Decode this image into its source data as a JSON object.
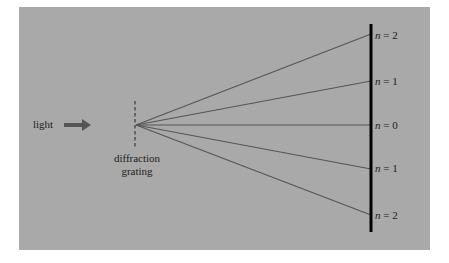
{
  "diagram": {
    "labels": {
      "light": "light",
      "grating_line1": "diffraction",
      "grating_line2": "grating"
    },
    "orders": [
      {
        "n_symbol": "n",
        "eq": " = 2",
        "y": 35
      },
      {
        "n_symbol": "n",
        "eq": " = 1",
        "y": 81
      },
      {
        "n_symbol": "n",
        "eq": " = 0",
        "y": 125
      },
      {
        "n_symbol": "n",
        "eq": " = 1",
        "y": 168
      },
      {
        "n_symbol": "n",
        "eq": " = 2",
        "y": 215
      }
    ],
    "colors": {
      "background": "#a9a9a9",
      "rays": "#555555",
      "screen": "#000000",
      "arrow": "#555555",
      "text": "#222222"
    }
  }
}
